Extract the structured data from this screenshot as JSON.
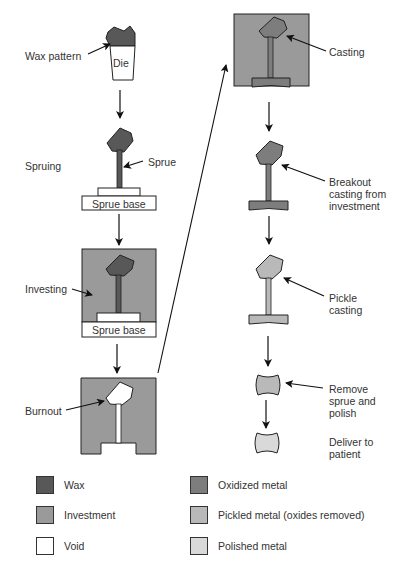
{
  "colors": {
    "wax": "#585858",
    "investment": "#9a9a9a",
    "void": "#ffffff",
    "oxidized_metal": "#7d7d7d",
    "pickled_metal": "#b9b9b9",
    "polished_metal": "#d9d9d9",
    "outline": "#2a2a2a"
  },
  "steps": {
    "wax_pattern": {
      "label": "Wax pattern",
      "die_label": "Die"
    },
    "spruing": {
      "label": "Spruing",
      "sprue_label": "Sprue",
      "base_label": "Sprue base"
    },
    "investing": {
      "label": "Investing",
      "base_label": "Sprue base"
    },
    "burnout": {
      "label": "Burnout"
    },
    "casting": {
      "label": "Casting"
    },
    "breakout": {
      "label_line1": "Breakout",
      "label_line2": "casting from",
      "label_line3": "investment"
    },
    "pickle": {
      "label_line1": "Pickle",
      "label_line2": "casting"
    },
    "remove": {
      "label_line1": "Remove",
      "label_line2": "sprue and",
      "label_line3": "polish"
    },
    "deliver": {
      "label_line1": "Deliver to",
      "label_line2": "patient"
    }
  },
  "legend": [
    {
      "label": "Wax",
      "color": "#585858"
    },
    {
      "label": "Investment",
      "color": "#9a9a9a"
    },
    {
      "label": "Void",
      "color": "#ffffff"
    },
    {
      "label": "Oxidized metal",
      "color": "#7d7d7d"
    },
    {
      "label": "Pickled metal (oxides removed)",
      "color": "#b9b9b9"
    },
    {
      "label": "Polished metal",
      "color": "#d9d9d9"
    }
  ]
}
